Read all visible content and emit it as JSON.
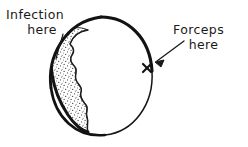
{
  "figure": {
    "background_color": "#ffffff",
    "ink_color": "#1a1a1a",
    "stipple_color": "#3a3a3a",
    "annotations": {
      "infection": {
        "line1": "Infection",
        "line2": "here",
        "leader_from": [
          63,
          34
        ],
        "leader_to": [
          56,
          59
        ]
      },
      "forceps": {
        "line1": "Forceps",
        "line2": "here",
        "arrow_from": [
          184,
          41
        ],
        "arrow_to": [
          155,
          62
        ]
      }
    },
    "marks": {
      "forceps_mark": {
        "glyph": "x",
        "x": 147,
        "y": 68
      }
    },
    "shape": {
      "name": "oval-outline",
      "bounds": [
        50,
        17,
        153,
        136
      ]
    },
    "region": {
      "name": "infection-region",
      "fill": "stipple"
    }
  }
}
